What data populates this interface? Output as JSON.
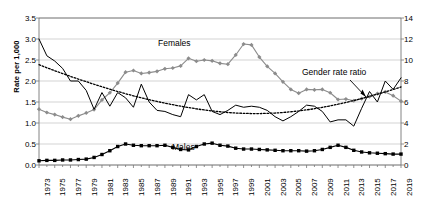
{
  "chart_data": {
    "type": "line",
    "title": "",
    "xlabel": "",
    "ylabel": "Rate per 1,000",
    "y2label": "",
    "ylim": [
      0,
      3.5
    ],
    "y2lim": [
      0,
      14
    ],
    "yticks": [
      "0.0",
      "0.5",
      "1.0",
      "1.5",
      "2.0",
      "2.5",
      "3.0",
      "3.5"
    ],
    "y2ticks": [
      "0",
      "2",
      "4",
      "6",
      "8",
      "10",
      "12",
      "14"
    ],
    "grid": true,
    "legend_position": "inline-annotations",
    "x": [
      1973,
      1974,
      1975,
      1976,
      1977,
      1978,
      1979,
      1980,
      1981,
      1982,
      1983,
      1984,
      1985,
      1986,
      1987,
      1988,
      1989,
      1990,
      1991,
      1992,
      1993,
      1994,
      1995,
      1996,
      1997,
      1998,
      1999,
      2000,
      2001,
      2002,
      2003,
      2004,
      2005,
      2006,
      2007,
      2008,
      2009,
      2010,
      2011,
      2012,
      2013,
      2014,
      2015,
      2016,
      2017,
      2018,
      2019
    ],
    "xticklabels": [
      "1973",
      "1975",
      "1977",
      "1979",
      "1981",
      "1983",
      "1985",
      "1987",
      "1989",
      "1991",
      "1993",
      "1995",
      "1997",
      "1999",
      "2001",
      "2003",
      "2005",
      "2007",
      "2009",
      "2011",
      "2013",
      "2015",
      "2017",
      "2019"
    ],
    "xtick_step": 2,
    "series": [
      {
        "name": "Females",
        "axis": "left",
        "color": "#8c8c8c",
        "marker": "diamond",
        "style": "solid",
        "values": [
          1.33,
          1.25,
          1.2,
          1.14,
          1.09,
          1.17,
          1.24,
          1.32,
          1.55,
          1.72,
          1.95,
          2.21,
          2.25,
          2.18,
          2.2,
          2.23,
          2.29,
          2.31,
          2.36,
          2.54,
          2.47,
          2.5,
          2.48,
          2.42,
          2.4,
          2.62,
          2.88,
          2.86,
          2.57,
          2.35,
          2.18,
          1.98,
          1.8,
          1.71,
          1.8,
          1.79,
          1.8,
          1.72,
          1.56,
          1.57,
          1.53,
          1.58,
          1.63,
          1.7,
          1.74,
          1.65,
          1.52
        ]
      },
      {
        "name": "Males",
        "axis": "left",
        "color": "#000000",
        "marker": "square",
        "style": "solid",
        "values": [
          0.1,
          0.11,
          0.11,
          0.12,
          0.12,
          0.13,
          0.14,
          0.18,
          0.25,
          0.34,
          0.44,
          0.5,
          0.47,
          0.46,
          0.46,
          0.46,
          0.47,
          0.42,
          0.37,
          0.36,
          0.44,
          0.5,
          0.52,
          0.47,
          0.45,
          0.4,
          0.38,
          0.38,
          0.37,
          0.36,
          0.35,
          0.34,
          0.34,
          0.34,
          0.33,
          0.34,
          0.37,
          0.42,
          0.47,
          0.42,
          0.35,
          0.31,
          0.29,
          0.28,
          0.27,
          0.26,
          0.26
        ]
      },
      {
        "name": "Gender rate ratio",
        "axis": "right",
        "color": "#000000",
        "marker": "none",
        "style": "solid",
        "values": [
          12.0,
          10.4,
          9.9,
          9.2,
          8.0,
          8.0,
          7.1,
          5.3,
          6.9,
          5.6,
          6.9,
          6.4,
          5.5,
          7.7,
          6.0,
          5.2,
          5.1,
          4.8,
          4.6,
          6.7,
          6.2,
          6.7,
          5.1,
          4.8,
          5.2,
          5.7,
          5.5,
          5.6,
          5.5,
          5.2,
          4.6,
          4.2,
          4.6,
          5.1,
          5.7,
          5.6,
          5.1,
          4.1,
          4.3,
          4.3,
          3.7,
          5.4,
          7.0,
          6.0,
          8.0,
          7.2,
          8.3
        ]
      },
      {
        "name": "Gender rate ratio trend",
        "axis": "right",
        "color": "#000000",
        "marker": "none",
        "style": "dotted",
        "values": [
          9.55,
          9.26,
          8.98,
          8.71,
          8.44,
          8.18,
          7.93,
          7.69,
          7.45,
          7.22,
          7.0,
          6.79,
          6.59,
          6.4,
          6.22,
          6.05,
          5.89,
          5.74,
          5.6,
          5.47,
          5.35,
          5.24,
          5.15,
          5.07,
          5.0,
          4.95,
          4.92,
          4.9,
          4.9,
          4.92,
          4.95,
          5.0,
          5.07,
          5.15,
          5.25,
          5.36,
          5.49,
          5.63,
          5.79,
          5.96,
          6.14,
          6.33,
          6.53,
          6.74,
          6.96,
          7.19,
          7.43
        ]
      }
    ],
    "annotations": [
      {
        "name": "females-label",
        "text": "Females",
        "x_px": 158,
        "y_px": 44
      },
      {
        "name": "males-label",
        "text": "Males",
        "x_px": 172,
        "y_px": 148
      },
      {
        "name": "gender-rate-ratio-label",
        "text": "Gender rate ratio",
        "x_px": 305,
        "y_px": 73
      }
    ]
  }
}
